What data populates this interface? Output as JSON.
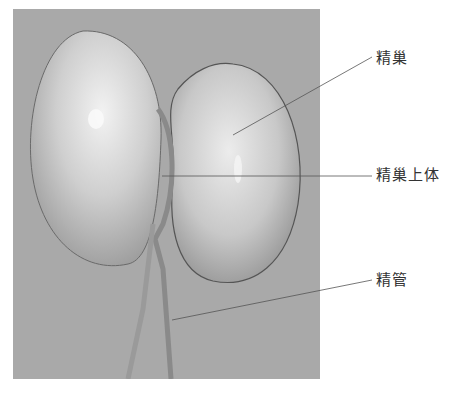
{
  "figure": {
    "background_color": "#a9a9a9",
    "labels": [
      {
        "text": "精巢",
        "x": 376,
        "y": 46
      },
      {
        "text": "精巢上体",
        "x": 376,
        "y": 163
      },
      {
        "text": "精管",
        "x": 376,
        "y": 268
      }
    ]
  }
}
